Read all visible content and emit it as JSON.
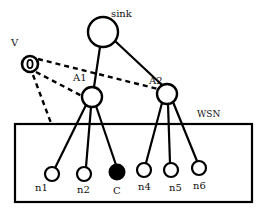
{
  "diagram": {
    "colors": {
      "stroke": "#000000",
      "background": "#ffffff",
      "compromised_fill": "#000000"
    },
    "region": {
      "label": "WSN",
      "x": 15,
      "y": 124,
      "w": 237,
      "h": 78
    },
    "nodes": {
      "sink": {
        "label": "sink",
        "cx": 103,
        "cy": 32,
        "r": 15,
        "type": "sink"
      },
      "A1": {
        "label": "A1",
        "cx": 92,
        "cy": 97,
        "r": 10,
        "type": "aggregator"
      },
      "A2": {
        "label": "A2",
        "cx": 167,
        "cy": 94,
        "r": 10,
        "type": "aggregator"
      },
      "V": {
        "label": "V",
        "cx": 30,
        "cy": 64,
        "r": 8,
        "type": "adversary"
      },
      "n1": {
        "label": "n1",
        "cx": 52,
        "cy": 174,
        "r": 7,
        "type": "sensor"
      },
      "n2": {
        "label": "n2",
        "cx": 84,
        "cy": 174,
        "r": 7,
        "type": "sensor"
      },
      "C": {
        "label": "C",
        "cx": 117,
        "cy": 172,
        "r": 7,
        "type": "compromised"
      },
      "n4": {
        "label": "n4",
        "cx": 144,
        "cy": 170,
        "r": 7,
        "type": "sensor"
      },
      "n5": {
        "label": "n5",
        "cx": 171,
        "cy": 170,
        "r": 7,
        "type": "sensor"
      },
      "n6": {
        "label": "n6",
        "cx": 199,
        "cy": 168,
        "r": 7,
        "type": "sensor"
      }
    },
    "edges_solid": [
      [
        "sink",
        "A1"
      ],
      [
        "sink",
        "A2"
      ],
      [
        "A1",
        "n1"
      ],
      [
        "A1",
        "n2"
      ],
      [
        "A1",
        "C"
      ],
      [
        "A2",
        "n4"
      ],
      [
        "A2",
        "n5"
      ],
      [
        "A2",
        "n6"
      ]
    ],
    "edges_dashed": [
      [
        "V",
        "A2"
      ],
      [
        "V",
        "A1"
      ],
      [
        "V",
        "WSN"
      ]
    ]
  }
}
